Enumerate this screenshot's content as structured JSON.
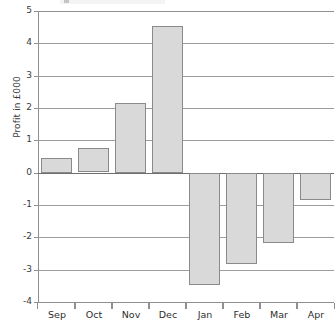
{
  "chart_data": {
    "type": "bar",
    "title": "",
    "xlabel": "",
    "ylabel": "Profit in £000",
    "categories": [
      "Sep",
      "Oct",
      "Nov",
      "Dec",
      "Jan",
      "Feb",
      "Mar",
      "Apr"
    ],
    "values": [
      0.45,
      0.75,
      2.15,
      4.55,
      -3.45,
      -2.8,
      -2.15,
      -0.85
    ],
    "ylim": [
      -4,
      5
    ],
    "ytick_labels": [
      "5",
      "4",
      "3",
      "2",
      "1",
      "0",
      "-1",
      "-2",
      "-3",
      "-4"
    ],
    "ytick_values": [
      5,
      4,
      3,
      2,
      1,
      0,
      -1,
      -2,
      -3,
      -4
    ],
    "grid": true,
    "legend": "none",
    "bar_fill_color": "#d9d9d9",
    "bar_edge_color": "#8a8a8a",
    "gridline_color": "#9d9d9d",
    "zero_line_color": "#6e6e6e",
    "axis_color": "#8f8f8f",
    "text_color": "#3b3b3b"
  }
}
